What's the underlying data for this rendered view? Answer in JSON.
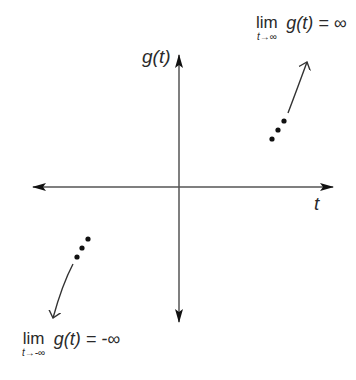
{
  "diagram": {
    "type": "coordinate-axes-with-limit-behavior",
    "axes": {
      "x_label": "t",
      "y_label": "g(t)"
    },
    "annotations": {
      "top_right": {
        "lim": "lim",
        "subscript": "t→∞",
        "expression": "g(t) = ∞"
      },
      "bottom_left": {
        "lim": "lim",
        "subscript": "t→-∞",
        "expression": "g(t) = -∞"
      }
    },
    "colors": {
      "ink": "#2a2a2a",
      "axis": "#555555",
      "background": "#ffffff"
    }
  }
}
